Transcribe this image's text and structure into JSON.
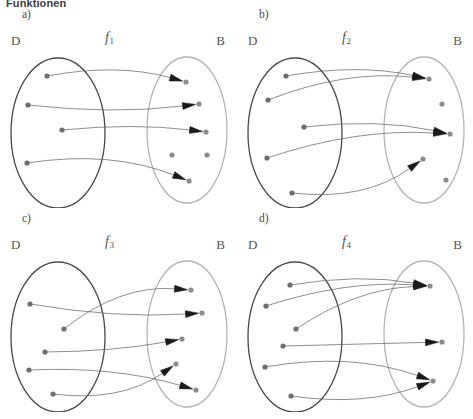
{
  "heading": "Funktionen",
  "colors": {
    "domain_ellipse": "#4a4a4a",
    "codomain_ellipse": "#b5b5b5",
    "dot": "#8c8c8c",
    "domain_dot": "#6e6e6e",
    "edge": "#6a6a6a",
    "arrowhead": "#1a1a1a",
    "label": "#555555",
    "background": "#ffffff"
  },
  "labels": {
    "domain_set": "D",
    "codomain_set": "B"
  },
  "panels": [
    {
      "tag": "a)",
      "function_name": "f",
      "function_subscript": "1",
      "domain_label": "D",
      "codomain_label": "B",
      "domain_dots": [
        {
          "id": "a-d1",
          "x": 47,
          "y": 68
        },
        {
          "id": "a-d2",
          "x": 28,
          "y": 97
        },
        {
          "id": "a-d3",
          "x": 62,
          "y": 122
        },
        {
          "id": "a-d4",
          "x": 27,
          "y": 155
        }
      ],
      "codomain_dots": [
        {
          "id": "a-b1",
          "x": 186,
          "y": 74
        },
        {
          "id": "a-b2",
          "x": 199,
          "y": 96
        },
        {
          "id": "a-b3",
          "x": 206,
          "y": 124
        },
        {
          "id": "a-b4",
          "x": 172,
          "y": 147
        },
        {
          "id": "a-b5",
          "x": 207,
          "y": 147
        },
        {
          "id": "a-b6",
          "x": 189,
          "y": 173
        }
      ],
      "edges": [
        {
          "from": "a-d1",
          "to": "a-b1",
          "curve": -16
        },
        {
          "from": "a-d2",
          "to": "a-b2",
          "curve": 10
        },
        {
          "from": "a-d3",
          "to": "a-b3",
          "curve": -8
        },
        {
          "from": "a-d4",
          "to": "a-b6",
          "curve": -22
        }
      ],
      "mapped_count": 4,
      "unmapped_codomain": [
        "a-b4",
        "a-b5"
      ]
    },
    {
      "tag": "b)",
      "function_name": "f",
      "function_subscript": "2",
      "domain_label": "D",
      "codomain_label": "B",
      "domain_dots": [
        {
          "id": "b-d1",
          "x": 49,
          "y": 68
        },
        {
          "id": "b-d2",
          "x": 31,
          "y": 92
        },
        {
          "id": "b-d3",
          "x": 67,
          "y": 119
        },
        {
          "id": "b-d4",
          "x": 30,
          "y": 150
        },
        {
          "id": "b-d5",
          "x": 55,
          "y": 185
        }
      ],
      "codomain_dots": [
        {
          "id": "b-b1",
          "x": 192,
          "y": 71
        },
        {
          "id": "b-b2",
          "x": 205,
          "y": 96
        },
        {
          "id": "b-b3",
          "x": 213,
          "y": 126
        },
        {
          "id": "b-b4",
          "x": 186,
          "y": 151
        },
        {
          "id": "b-b5",
          "x": 209,
          "y": 172
        }
      ],
      "edges": [
        {
          "from": "b-d1",
          "to": "b-b1",
          "curve": -14
        },
        {
          "from": "b-d2",
          "to": "b-b1",
          "curve": -20
        },
        {
          "from": "b-d3",
          "to": "b-b3",
          "curve": -12
        },
        {
          "from": "b-d4",
          "to": "b-b3",
          "curve": -18
        },
        {
          "from": "b-d5",
          "to": "b-b4",
          "curve": 26
        }
      ],
      "mapped_count": 5,
      "unmapped_codomain": [
        "b-b2",
        "b-b5"
      ]
    },
    {
      "tag": "c)",
      "function_name": "f",
      "function_subscript": "3",
      "domain_label": "D",
      "codomain_label": "B",
      "domain_dots": [
        {
          "id": "c-d1",
          "x": 30,
          "y": 92
        },
        {
          "id": "c-d2",
          "x": 64,
          "y": 117
        },
        {
          "id": "c-d3",
          "x": 45,
          "y": 140
        },
        {
          "id": "c-d4",
          "x": 29,
          "y": 158
        },
        {
          "id": "c-d5",
          "x": 53,
          "y": 182
        }
      ],
      "codomain_dots": [
        {
          "id": "c-b1",
          "x": 191,
          "y": 78
        },
        {
          "id": "c-b2",
          "x": 202,
          "y": 101
        },
        {
          "id": "c-b3",
          "x": 182,
          "y": 127
        },
        {
          "id": "c-b4",
          "x": 176,
          "y": 152
        },
        {
          "id": "c-b5",
          "x": 196,
          "y": 178
        }
      ],
      "edges": [
        {
          "from": "c-d2",
          "to": "c-b1",
          "curve": -26
        },
        {
          "from": "c-d1",
          "to": "c-b2",
          "curve": 10
        },
        {
          "from": "c-d3",
          "to": "c-b3",
          "curve": 6
        },
        {
          "from": "c-d4",
          "to": "c-b5",
          "curve": -14
        },
        {
          "from": "c-d5",
          "to": "c-b4",
          "curve": 24
        }
      ],
      "mapped_count": 5,
      "unmapped_codomain": []
    },
    {
      "tag": "d)",
      "function_name": "f",
      "function_subscript": "4",
      "domain_label": "D",
      "codomain_label": "B",
      "domain_dots": [
        {
          "id": "d-d1",
          "x": 53,
          "y": 73
        },
        {
          "id": "d-d2",
          "x": 29,
          "y": 94
        },
        {
          "id": "d-d3",
          "x": 59,
          "y": 117
        },
        {
          "id": "d-d4",
          "x": 46,
          "y": 134
        },
        {
          "id": "d-d5",
          "x": 28,
          "y": 155
        },
        {
          "id": "d-d6",
          "x": 54,
          "y": 184
        }
      ],
      "codomain_dots": [
        {
          "id": "d-b1",
          "x": 193,
          "y": 74
        },
        {
          "id": "d-b2",
          "x": 205,
          "y": 130
        },
        {
          "id": "d-b3",
          "x": 196,
          "y": 169
        }
      ],
      "edges": [
        {
          "from": "d-d1",
          "to": "d-b1",
          "curve": -12
        },
        {
          "from": "d-d2",
          "to": "d-b1",
          "curve": -16
        },
        {
          "from": "d-d3",
          "to": "d-b1",
          "curve": -20
        },
        {
          "from": "d-d4",
          "to": "d-b2",
          "curve": 0
        },
        {
          "from": "d-d5",
          "to": "d-b3",
          "curve": -22
        },
        {
          "from": "d-d6",
          "to": "d-b3",
          "curve": 18
        }
      ],
      "mapped_count": 6,
      "unmapped_codomain": []
    }
  ],
  "geometry": {
    "domain_ellipse": {
      "cx": 58,
      "cy": 125,
      "rx": 47,
      "ry": 75
    },
    "codomain_ellipse": {
      "cx": 187,
      "cy": 122,
      "rx": 40,
      "ry": 73
    },
    "dot_radius": 2.6
  }
}
